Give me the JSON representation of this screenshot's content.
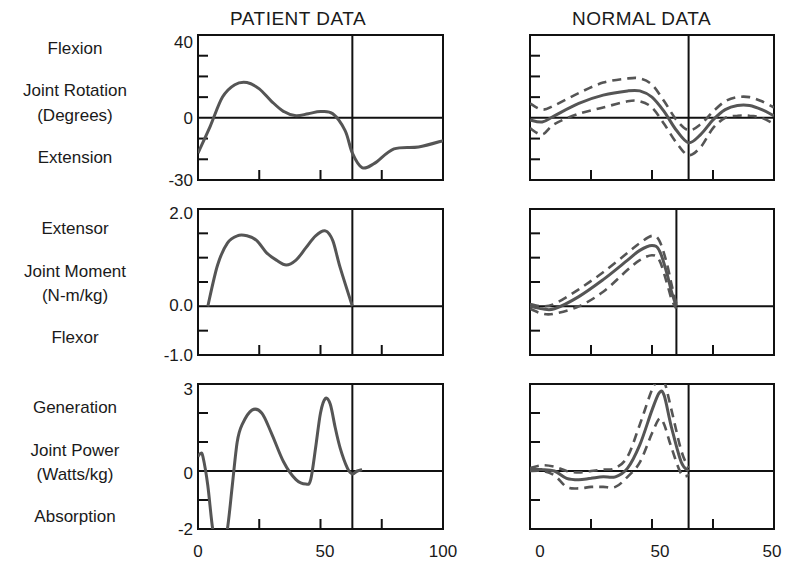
{
  "column_titles": {
    "patient": "PATIENT DATA",
    "normal": "NORMAL DATA"
  },
  "rows": [
    {
      "top_label": "Flexion",
      "measure_line1": "Joint Rotation",
      "measure_line2": "(Degrees)",
      "bottom_label": "Extension",
      "yticks": [
        "40",
        "0",
        "-30"
      ]
    },
    {
      "top_label": "Extensor",
      "measure_line1": "Joint Moment",
      "measure_line2": "(N-m/kg)",
      "bottom_label": "Flexor",
      "yticks": [
        "2.0",
        "0.0",
        "-1.0"
      ]
    },
    {
      "top_label": "Generation",
      "measure_line1": "Joint Power",
      "measure_line2": "(Watts/kg)",
      "bottom_label": "Absorption",
      "yticks": [
        "3",
        "0",
        "-2"
      ]
    }
  ],
  "xticks": {
    "patient": [
      "0",
      "50",
      "100"
    ],
    "normal": [
      "0",
      "50",
      "50"
    ]
  },
  "colors": {
    "curve": "#555555",
    "axis": "#111111"
  },
  "chart_data": [
    {
      "type": "line",
      "title": "PATIENT DATA - Joint Rotation",
      "ylabel": "Joint Rotation (Degrees)",
      "xlabel": "% gait cycle",
      "xlim": [
        0,
        100
      ],
      "ylim": [
        -30,
        40
      ],
      "toe_off_x": 63,
      "series": [
        {
          "name": "patient",
          "x": [
            0,
            5,
            10,
            15,
            20,
            25,
            30,
            35,
            40,
            45,
            50,
            55,
            60,
            63,
            67,
            72,
            80,
            90,
            100
          ],
          "values": [
            -17,
            -4,
            10,
            16,
            17,
            14,
            8,
            3,
            1,
            2,
            3,
            2,
            -6,
            -17,
            -24,
            -22,
            -15,
            -14,
            -11
          ]
        }
      ]
    },
    {
      "type": "line",
      "title": "NORMAL DATA - Joint Rotation",
      "ylabel": "Joint Rotation (Degrees)",
      "xlim": [
        0,
        100
      ],
      "ylim": [
        -30,
        40
      ],
      "toe_off_x": 65,
      "series": [
        {
          "name": "mean",
          "x": [
            0,
            5,
            10,
            20,
            30,
            40,
            45,
            50,
            55,
            60,
            65,
            70,
            75,
            80,
            85,
            90,
            95,
            100
          ],
          "values": [
            -1,
            -2,
            1,
            7,
            11,
            13,
            13,
            10,
            3,
            -6,
            -12,
            -8,
            -1,
            4,
            6,
            6,
            4,
            1
          ]
        },
        {
          "name": "upper_sd",
          "x": [
            0,
            5,
            10,
            20,
            30,
            40,
            45,
            50,
            55,
            60,
            65,
            70,
            75,
            80,
            85,
            90,
            95,
            100
          ],
          "values": [
            7,
            4,
            6,
            12,
            17,
            19,
            19,
            16,
            8,
            -1,
            -6,
            -3,
            3,
            8,
            10,
            10,
            8,
            5
          ]
        },
        {
          "name": "lower_sd",
          "x": [
            0,
            5,
            10,
            20,
            30,
            40,
            45,
            50,
            55,
            60,
            65,
            70,
            75,
            80,
            85,
            90,
            95,
            100
          ],
          "values": [
            -5,
            -8,
            -3,
            2,
            5,
            8,
            8,
            5,
            -3,
            -12,
            -18,
            -14,
            -5,
            0,
            1,
            1,
            0,
            -3
          ]
        }
      ]
    },
    {
      "type": "line",
      "title": "PATIENT DATA - Joint Moment",
      "ylabel": "Joint Moment (N-m/kg)",
      "xlim": [
        0,
        100
      ],
      "ylim": [
        -1.0,
        2.0
      ],
      "toe_off_x": 63,
      "series": [
        {
          "name": "patient",
          "x": [
            4,
            8,
            12,
            16,
            20,
            24,
            28,
            32,
            36,
            40,
            44,
            48,
            52,
            55,
            58,
            63
          ],
          "values": [
            0,
            0.85,
            1.3,
            1.45,
            1.45,
            1.35,
            1.1,
            0.95,
            0.85,
            0.95,
            1.2,
            1.45,
            1.55,
            1.35,
            0.8,
            0
          ]
        }
      ]
    },
    {
      "type": "line",
      "title": "NORMAL DATA - Joint Moment",
      "ylabel": "Joint Moment (N-m/kg)",
      "xlim": [
        0,
        100
      ],
      "ylim": [
        -1.0,
        2.0
      ],
      "toe_off_x": 60,
      "series": [
        {
          "name": "mean",
          "x": [
            0,
            5,
            10,
            20,
            30,
            40,
            45,
            50,
            53,
            56,
            58,
            60
          ],
          "values": [
            0,
            -0.05,
            -0.05,
            0.2,
            0.55,
            0.95,
            1.15,
            1.25,
            1.15,
            0.7,
            0.3,
            0
          ]
        },
        {
          "name": "upper_sd",
          "x": [
            0,
            5,
            10,
            20,
            30,
            40,
            45,
            50,
            53,
            56,
            58,
            60
          ],
          "values": [
            0.05,
            0.0,
            0.05,
            0.35,
            0.7,
            1.1,
            1.3,
            1.45,
            1.35,
            0.9,
            0.45,
            0.05
          ]
        },
        {
          "name": "lower_sd",
          "x": [
            0,
            5,
            10,
            20,
            30,
            40,
            45,
            50,
            53,
            56,
            58,
            60
          ],
          "values": [
            -0.05,
            -0.15,
            -0.15,
            0.0,
            0.3,
            0.75,
            0.95,
            1.05,
            0.95,
            0.5,
            0.15,
            -0.05
          ]
        }
      ]
    },
    {
      "type": "line",
      "title": "PATIENT DATA - Joint Power",
      "ylabel": "Joint Power (Watts/kg)",
      "xlim": [
        0,
        100
      ],
      "ylim": [
        -2,
        3
      ],
      "toe_off_x": 63,
      "series": [
        {
          "name": "patient",
          "x": [
            0,
            1,
            2,
            4,
            6,
            8,
            10,
            12,
            14,
            16,
            18,
            22,
            26,
            30,
            35,
            40,
            44,
            46,
            48,
            50,
            52,
            54,
            56,
            58,
            61,
            63,
            65,
            67
          ],
          "values": [
            0.5,
            0.6,
            0.5,
            -0.5,
            -2.0,
            -2.6,
            -2.6,
            -2.0,
            -0.5,
            1.0,
            1.6,
            2.1,
            2.0,
            1.3,
            0.3,
            -0.3,
            -0.45,
            -0.3,
            0.8,
            2.0,
            2.5,
            2.3,
            1.5,
            0.8,
            0.1,
            -0.1,
            0.0,
            0.05
          ]
        }
      ]
    },
    {
      "type": "line",
      "title": "NORMAL DATA - Joint Power",
      "ylabel": "Joint Power (Watts/kg)",
      "xlim": [
        0,
        100
      ],
      "ylim": [
        -2,
        3
      ],
      "toe_off_x": 65,
      "series": [
        {
          "name": "mean",
          "x": [
            0,
            5,
            10,
            15,
            20,
            25,
            30,
            35,
            40,
            45,
            50,
            53,
            55,
            58,
            62,
            65
          ],
          "values": [
            0.05,
            0.05,
            0.0,
            -0.25,
            -0.3,
            -0.25,
            -0.2,
            -0.2,
            0.1,
            0.9,
            2.1,
            2.7,
            2.6,
            1.5,
            0.3,
            0.0
          ]
        },
        {
          "name": "upper_sd",
          "x": [
            0,
            5,
            10,
            15,
            20,
            25,
            30,
            35,
            40,
            45,
            50,
            53,
            55,
            58,
            62,
            65
          ],
          "values": [
            0.1,
            0.2,
            0.15,
            0.0,
            -0.05,
            0.0,
            0.05,
            0.1,
            0.5,
            1.6,
            2.8,
            3.2,
            3.1,
            2.1,
            0.7,
            0.1
          ]
        },
        {
          "name": "lower_sd",
          "x": [
            0,
            5,
            10,
            15,
            20,
            25,
            30,
            35,
            40,
            45,
            50,
            53,
            55,
            58,
            62,
            65
          ],
          "values": [
            0.0,
            0.0,
            -0.15,
            -0.55,
            -0.6,
            -0.55,
            -0.55,
            -0.55,
            -0.2,
            0.3,
            1.3,
            1.8,
            1.6,
            0.8,
            -0.1,
            -0.15
          ]
        }
      ]
    }
  ]
}
